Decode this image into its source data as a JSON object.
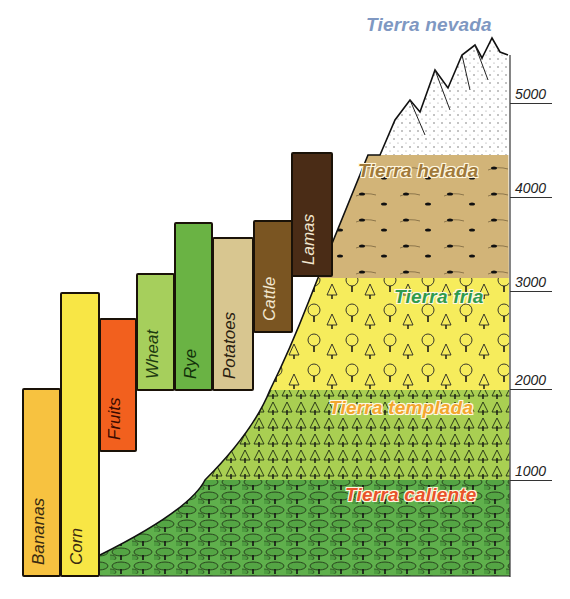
{
  "diagram": {
    "zones": [
      {
        "id": "nevada",
        "label": "Tierra nevada",
        "color": "#ffffff",
        "label_color": "#7f98c2",
        "top": 35,
        "bottom": 155
      },
      {
        "id": "helada",
        "label": "Tierra helada",
        "color": "#d2b478",
        "label_color": "#a0793a",
        "top": 155,
        "bottom": 278
      },
      {
        "id": "fria",
        "label": "Tierra fria",
        "color": "#f6ec5c",
        "label_color": "#2f9b4c",
        "top": 278,
        "bottom": 390
      },
      {
        "id": "templada",
        "label": "Tierra templada",
        "color": "#a9cf52",
        "label_color": "#f3a62e",
        "top": 390,
        "bottom": 480
      },
      {
        "id": "caliente",
        "label": "Tierra caliente",
        "color": "#5fb04c",
        "label_color": "#e8522a",
        "top": 480,
        "bottom": 576
      }
    ],
    "axis": {
      "ticks": [
        {
          "label": "5000",
          "y": 103
        },
        {
          "label": "4000",
          "y": 197
        },
        {
          "label": "3000",
          "y": 291
        },
        {
          "label": "2000",
          "y": 389
        },
        {
          "label": "1000",
          "y": 480
        }
      ]
    },
    "crops": [
      {
        "label": "Bananas",
        "color": "#f7c240",
        "text_color": "#3a2a10",
        "x": 22,
        "w": 38,
        "top": 388,
        "bottom": 577
      },
      {
        "label": "Corn",
        "color": "#f8e645",
        "text_color": "#3a2a10",
        "x": 60,
        "w": 39,
        "top": 292,
        "bottom": 577
      },
      {
        "label": "Fruits",
        "color": "#f2601e",
        "text_color": "#3a0a00",
        "x": 99,
        "w": 37,
        "top": 318,
        "bottom": 452
      },
      {
        "label": "Wheat",
        "color": "#a6cf5c",
        "text_color": "#1d3a10",
        "x": 136,
        "w": 38,
        "top": 273,
        "bottom": 391
      },
      {
        "label": "Rye",
        "color": "#6ab344",
        "text_color": "#12300a",
        "x": 174,
        "w": 38,
        "top": 222,
        "bottom": 391
      },
      {
        "label": "Potatoes",
        "color": "#d8c690",
        "text_color": "#2a2010",
        "x": 212,
        "w": 41,
        "top": 237,
        "bottom": 391
      },
      {
        "label": "Cattle",
        "color": "#7a5522",
        "text_color": "#f1e6cf",
        "x": 253,
        "w": 39,
        "top": 220,
        "bottom": 333
      },
      {
        "label": "Lamas",
        "color": "#4a2c16",
        "text_color": "#f1e6cf",
        "x": 291,
        "w": 41,
        "top": 152,
        "bottom": 277
      }
    ]
  },
  "chart_data": {
    "type": "table",
    "ylabel": "Altitude (m)",
    "ylim": [
      0,
      5500
    ],
    "yticks": [
      1000,
      2000,
      3000,
      4000,
      5000
    ],
    "zones": [
      {
        "name": "Tierra caliente",
        "from_m": 0,
        "to_m": 1000
      },
      {
        "name": "Tierra templada",
        "from_m": 1000,
        "to_m": 2000
      },
      {
        "name": "Tierra fria",
        "from_m": 2000,
        "to_m": 3100
      },
      {
        "name": "Tierra helada",
        "from_m": 3100,
        "to_m": 4400
      },
      {
        "name": "Tierra nevada",
        "from_m": 4400,
        "to_m": 5500
      }
    ],
    "crops": [
      {
        "name": "Bananas",
        "from_m": 0,
        "to_m": 2000
      },
      {
        "name": "Corn",
        "from_m": 0,
        "to_m": 3000
      },
      {
        "name": "Fruits",
        "from_m": 1300,
        "to_m": 2700
      },
      {
        "name": "Wheat",
        "from_m": 2000,
        "to_m": 3200
      },
      {
        "name": "Rye",
        "from_m": 2000,
        "to_m": 3800
      },
      {
        "name": "Potatoes",
        "from_m": 2000,
        "to_m": 3600
      },
      {
        "name": "Cattle",
        "from_m": 2600,
        "to_m": 3800
      },
      {
        "name": "Lamas",
        "from_m": 3100,
        "to_m": 4400
      }
    ]
  }
}
